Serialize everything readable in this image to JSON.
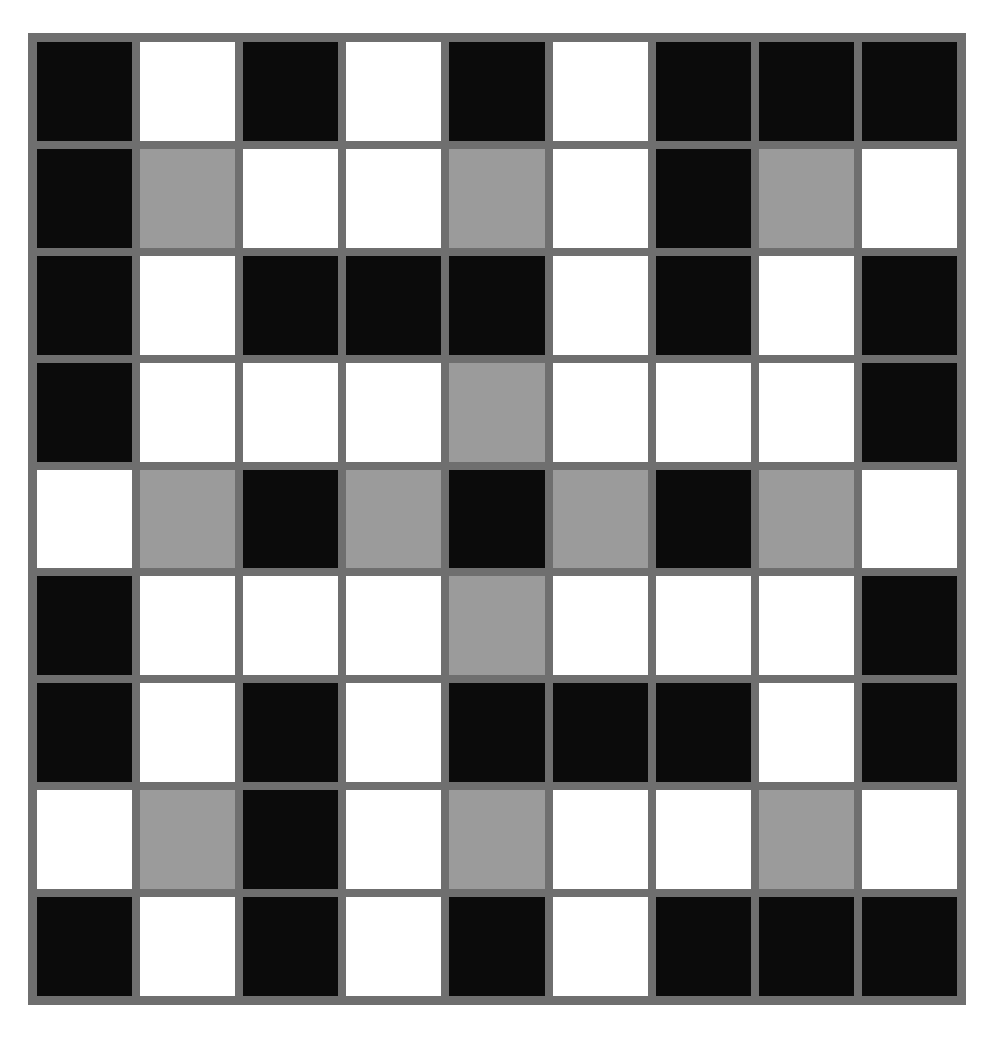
{
  "diagram": {
    "title": "",
    "rows": 9,
    "cols": 9,
    "legend": {
      "B": "black",
      "W": "white",
      "G": "gray"
    },
    "colors": {
      "border": "#6f6f6f",
      "B": "#0b0b0b",
      "W": "#ffffff",
      "G": "#9b9b9b"
    },
    "grid": [
      [
        "B",
        "W",
        "B",
        "W",
        "B",
        "W",
        "B",
        "B",
        "B"
      ],
      [
        "B",
        "G",
        "W",
        "W",
        "G",
        "W",
        "B",
        "G",
        "W"
      ],
      [
        "B",
        "W",
        "B",
        "B",
        "B",
        "W",
        "B",
        "W",
        "B"
      ],
      [
        "B",
        "W",
        "W",
        "W",
        "G",
        "W",
        "W",
        "W",
        "B"
      ],
      [
        "W",
        "G",
        "B",
        "G",
        "B",
        "G",
        "B",
        "G",
        "W"
      ],
      [
        "B",
        "W",
        "W",
        "W",
        "G",
        "W",
        "W",
        "W",
        "B"
      ],
      [
        "B",
        "W",
        "B",
        "W",
        "B",
        "B",
        "B",
        "W",
        "B"
      ],
      [
        "W",
        "G",
        "B",
        "W",
        "G",
        "W",
        "W",
        "G",
        "W"
      ],
      [
        "B",
        "W",
        "B",
        "W",
        "B",
        "W",
        "B",
        "B",
        "B"
      ]
    ]
  },
  "caption": {
    "text": ""
  }
}
